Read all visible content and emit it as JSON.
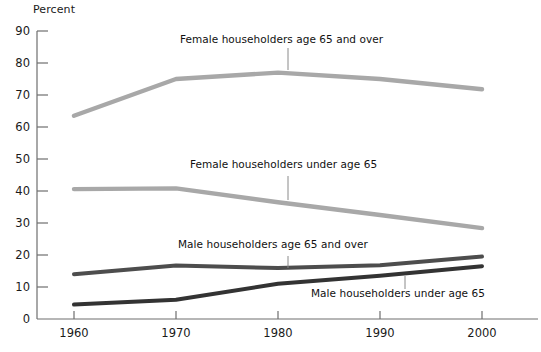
{
  "chart_data": {
    "type": "line",
    "title": "",
    "subtitle": "",
    "xlabel": "",
    "ylabel": "Percent",
    "x": [
      1960,
      1970,
      1980,
      1990,
      2000
    ],
    "xtick_labels": [
      "1960",
      "1970",
      "1980",
      "1990",
      "2000"
    ],
    "ytick_labels": [
      "0",
      "10",
      "20",
      "30",
      "40",
      "50",
      "60",
      "70",
      "80",
      "90"
    ],
    "ylim": [
      0,
      90
    ],
    "xlim": [
      1960,
      2000
    ],
    "grid": false,
    "legend": "inline-annotations",
    "series": [
      {
        "name": "Female householders age 65 and over",
        "values": [
          63.5,
          75.0,
          77.0,
          75.0,
          71.8
        ],
        "color": "#a8a8a8",
        "label_x": 180,
        "label_y": 38,
        "leader_x": 288,
        "leader_y_top": 48,
        "leader_y_bottom": 70
      },
      {
        "name": "Female householders under age 65",
        "values": [
          40.6,
          40.8,
          36.5,
          32.5,
          28.4
        ],
        "color": "#a8a8a8",
        "label_x": 190,
        "label_y": 163,
        "leader_x": 288,
        "leader_y_top": 176,
        "leader_y_bottom": 200
      },
      {
        "name": "Male householders age 65 and over",
        "values": [
          14.0,
          16.7,
          15.9,
          16.8,
          19.5
        ],
        "color": "#4d4d4d",
        "label_x": 178,
        "label_y": 243,
        "leader_x": 288,
        "leader_y_top": 256,
        "leader_y_bottom": 268
      },
      {
        "name": "Male householders under age 65",
        "values": [
          4.5,
          6.0,
          11.0,
          13.5,
          16.5
        ],
        "color": "#333333",
        "label_x": 311,
        "label_y": 292,
        "leader_x": 405,
        "leader_y_top": 276,
        "leader_y_bottom": 289
      }
    ]
  },
  "axes": {
    "y_title": "Percent",
    "y_ticks": [
      "90",
      "80",
      "70",
      "60",
      "50",
      "40",
      "30",
      "20",
      "10",
      "0"
    ],
    "x_ticks": [
      "1960",
      "1970",
      "1980",
      "1990",
      "2000"
    ]
  },
  "labels": {
    "female_65_over": "Female householders age 65 and over",
    "female_under_65": "Female householders under age 65",
    "male_65_over": "Male householders age 65 and over",
    "male_under_65": "Male householders under age 65"
  },
  "colors": {
    "female_line": "#a8a8a8",
    "male_65_line": "#4d4d4d",
    "male_under_line": "#333333",
    "axis": "#6e6e6e",
    "text": "#111111"
  }
}
